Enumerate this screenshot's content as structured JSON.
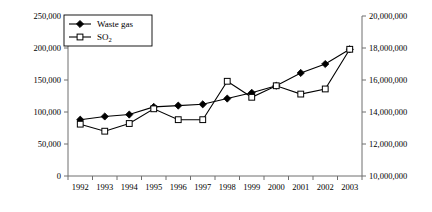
{
  "chart_data": {
    "type": "line",
    "title": "",
    "xlabel": "",
    "grid": false,
    "legend_position": "top-left",
    "categories": [
      "1992",
      "1993",
      "1994",
      "1995",
      "1996",
      "1997",
      "1998",
      "1999",
      "2000",
      "2001",
      "2002",
      "2003"
    ],
    "axes": {
      "left": {
        "label": "",
        "ylim": [
          0,
          250000
        ],
        "ticks": [
          0,
          50000,
          100000,
          150000,
          200000,
          250000
        ],
        "tick_labels": [
          "0",
          "50,000",
          "100,000",
          "150,000",
          "200,000",
          "250,000"
        ]
      },
      "right": {
        "label": "",
        "ylim": [
          10000000,
          20000000
        ],
        "ticks": [
          10000000,
          12000000,
          14000000,
          16000000,
          18000000,
          20000000
        ],
        "tick_labels": [
          "10,000,000",
          "12,000,000",
          "14,000,000",
          "16,000,000",
          "18,000,000",
          "20,000,000"
        ]
      }
    },
    "series": [
      {
        "name": "Waste gas",
        "axis": "left",
        "marker": "filled-diamond",
        "values": [
          88000,
          93000,
          96000,
          108000,
          110000,
          112000,
          121000,
          130000,
          141000,
          161000,
          175000,
          198000
        ]
      },
      {
        "name": "SO2",
        "name_display": "SO",
        "name_subscript": "2",
        "axis": "left",
        "marker": "open-square",
        "values": [
          81000,
          70000,
          82000,
          105000,
          88000,
          88000,
          148000,
          123000,
          141000,
          128000,
          136000,
          198000
        ]
      }
    ]
  },
  "legend": {
    "items": [
      {
        "label": "Waste gas",
        "subscript": ""
      },
      {
        "label": "SO",
        "subscript": "2"
      }
    ]
  }
}
